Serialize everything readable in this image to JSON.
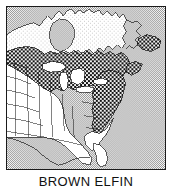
{
  "figure": {
    "caption": "BROWN ELFIN",
    "kind": "species-range-map",
    "region": "Eastern North America"
  },
  "legend": {
    "range_fill_label": "species range",
    "land_fill_label": "land outside range",
    "water_fill_label": "ocean / large lakes"
  },
  "colors": {
    "frame": "#1a1a1a",
    "outline": "#1a1a1a",
    "range_dark": "#4a4a4a",
    "range_dither_dot": "#101010",
    "land_white": "#ffffff",
    "land_light": "#ededed",
    "ocean_light": "#d9d9d9",
    "ocean_dither_dot": "#9a9a9a",
    "caption_text": "#111111",
    "page_background": "#ffffff"
  },
  "map": {
    "viewbox": "0 0 160 164",
    "ocean_rect": {
      "x": 0,
      "y": 0,
      "width": 160,
      "height": 164
    },
    "features": {
      "ocean_atlantic": "ocean",
      "hudson_bay": "water-body",
      "great_lakes": "water-body",
      "canada_north": "land-outside-range",
      "usa_west_central": "land-outside-range",
      "range_boreal_belt": "species-range",
      "range_great_lakes": "species-range",
      "range_new_england": "species-range",
      "range_appalachian_coast": "species-range",
      "range_newfoundland": "species-range",
      "range_nova_scotia": "species-range",
      "florida_peninsula": "land-outside-range"
    },
    "paths": {
      "canada_landmass": "M -2,26 L 8,22 L 18,19 L 30,16 L 40,13 L 48,11 L 54,13 L 58,10 L 62,7 L 66,5 L 70,8 L 74,5 L 78,3 L 84,5 L 88,2 L 93,4 L 97,2 L 101,5 L 106,3 L 112,5 L 118,3 L 124,6 L 130,4 L 138,6 L 146,4 L 154,6 L 162,4 L 162,52 L 154,54 L 146,50 L 140,46 L 134,48 L 128,44 L 122,47 L 116,43 L 110,46 L 104,42 L 98,45 L 92,42 L 86,45 L 80,42 L 74,45 L 68,43 L 62,46 L 56,44 L 50,47 L 44,45 L 38,48 L 32,46 L 26,49 L 20,47 L 14,50 L 8,48 L 2,51 L -2,49 Z",
      "hudson_bay": "M 52,14 L 58,12 L 64,14 L 68,18 L 70,24 L 69,32 L 66,39 L 61,44 L 55,46 L 49,44 L 45,39 L 43,32 L 44,24 L 47,18 Z",
      "range_main": "M -2,52 L 6,48 L 14,45 L 22,43 L 30,42 L 38,41 L 46,42 L 54,44 L 62,43 L 70,41 L 78,40 L 86,41 L 94,43 L 102,42 L 110,44 L 118,43 L 124,46 L 128,52 L 130,60 L 128,68 L 124,74 L 120,80 L 118,88 L 116,96 L 112,104 L 108,112 L 104,120 L 100,128 L 96,134 L 90,136 L 84,132 L 80,126 L 76,118 L 72,110 L 68,102 L 64,96 L 58,92 L 52,90 L 46,88 L 40,84 L 34,80 L 28,76 L 22,72 L 16,68 L 10,64 L 4,60 L -2,58 Z",
      "great_lakes": "M 44,70 L 52,66 L 60,68 L 66,72 L 72,70 L 78,74 L 82,80 L 78,86 L 70,88 L 62,86 L 54,84 L 48,80 L 44,76 Z",
      "usa_outline": "M -2,60 L 8,62 L 20,66 L 32,72 L 44,78 L 56,86 L 66,96 L 74,108 L 80,120 L 86,132 L 92,142 L 96,150 L 100,156 L 96,160 L 88,158 L 82,150 L 76,140 L 70,130 L 62,124 L 52,122 L 42,122 L 32,122 L 22,122 L 12,122 L 2,122 L -2,122 Z",
      "florida": "M 96,136 L 100,142 L 102,150 L 101,158 L 97,162 L 93,158 L 92,150 L 93,142 Z",
      "newfoundland": "M 136,40 L 146,36 L 156,38 L 160,44 L 154,50 L 144,52 L 136,48 Z",
      "nova_scotia": "M 128,66 L 136,62 L 142,64 L 140,70 L 132,74 L 126,72 Z"
    },
    "state_borders": [
      "M 0,62 L 30,62",
      "M 0,76 L 36,78",
      "M 0,92 L 38,94",
      "M 0,108 L 42,110",
      "M 0,124 L 46,126",
      "M 10,56 L 12,126",
      "M 24,58 L 26,126",
      "M 38,62 L 40,126",
      "M 52,72 L 54,124",
      "M 66,86 L 68,124",
      "M 46,126 L 100,130"
    ]
  }
}
